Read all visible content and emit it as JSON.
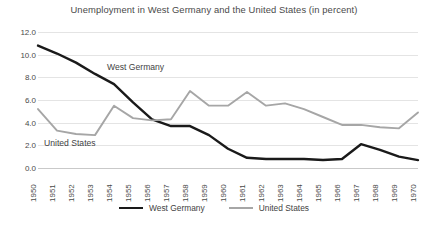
{
  "chart_data": {
    "type": "line",
    "title": "Unemployment in West Germany and the United States (in percent)",
    "xlabel": "",
    "ylabel": "",
    "ylim": [
      0.0,
      12.0
    ],
    "ytick_step": 2.0,
    "grid": true,
    "legend_position": "bottom-center",
    "ytick_labels": [
      "12.0",
      "10.0",
      "8.0",
      "6.0",
      "4.0",
      "2.0",
      "0.0"
    ],
    "ytick_values": [
      12.0,
      10.0,
      8.0,
      6.0,
      4.0,
      2.0,
      0.0
    ],
    "categories": [
      "1950",
      "1951",
      "1952",
      "1953",
      "1954",
      "1955",
      "1956",
      "1957",
      "1958",
      "1959",
      "1960",
      "1961",
      "1962",
      "1963",
      "1964",
      "1965",
      "1966",
      "1967",
      "1968",
      "1969",
      "1970"
    ],
    "x": [
      1950,
      1951,
      1952,
      1953,
      1954,
      1955,
      1956,
      1957,
      1958,
      1959,
      1960,
      1961,
      1962,
      1963,
      1964,
      1965,
      1966,
      1967,
      1968,
      1969,
      1970
    ],
    "series": [
      {
        "name": "West Germany",
        "color": "#1a1a1a",
        "values": [
          10.8,
          10.1,
          9.3,
          8.3,
          7.4,
          5.8,
          4.3,
          3.7,
          3.7,
          2.9,
          1.7,
          0.9,
          0.8,
          0.8,
          0.8,
          0.7,
          0.8,
          2.1,
          1.6,
          1.0,
          0.7
        ]
      },
      {
        "name": "United States",
        "color": "#a6a6a6",
        "values": [
          5.2,
          3.3,
          3.0,
          2.9,
          5.5,
          4.4,
          4.2,
          4.3,
          6.8,
          5.5,
          5.5,
          6.7,
          5.5,
          5.7,
          5.2,
          4.5,
          3.8,
          3.8,
          3.6,
          3.5,
          4.9
        ]
      }
    ],
    "annotations": [
      {
        "text": "West Germany",
        "series": "West Germany"
      },
      {
        "text": "United States",
        "series": "United States"
      }
    ]
  },
  "legend": {
    "items": [
      {
        "label": "West Germany",
        "color": "#1a1a1a"
      },
      {
        "label": "United States",
        "color": "#a6a6a6"
      }
    ]
  },
  "inline_labels": {
    "west_germany": "West Germany",
    "united_states": "United States"
  }
}
